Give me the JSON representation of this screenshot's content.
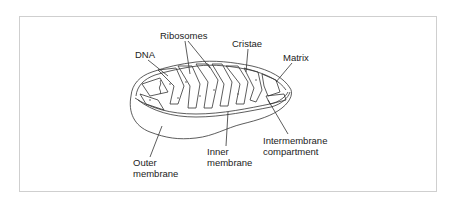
{
  "diagram": {
    "labels": {
      "ribosomes": "Ribosomes",
      "cristae": "Cristae",
      "dna": "DNA",
      "matrix": "Matrix",
      "intermembrane_line1": "Intermembrane",
      "intermembrane_line2": "compartment",
      "inner_line1": "Inner",
      "inner_line2": "membrane",
      "outer_line1": "Outer",
      "outer_line2": "membrane"
    },
    "colors": {
      "frame_border": "#cfcfcf",
      "line": "#333333",
      "text": "#222222",
      "background": "#ffffff"
    }
  }
}
